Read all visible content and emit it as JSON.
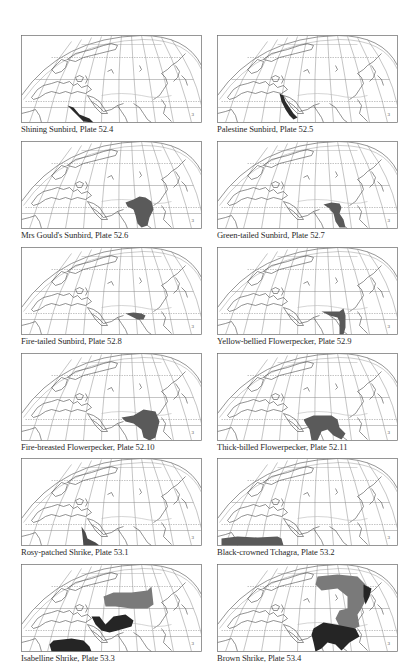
{
  "page": {
    "panels": [
      {
        "caption": "Shining Sunbird, Plate 52.4",
        "range_grey": "",
        "range_dark": "M46,70 L50,74 L56,80 L62,86 L72,87 L68,83 L58,79 L52,72 Z"
      },
      {
        "caption": "Palestine Sunbird, Plate 52.5",
        "range_grey": "",
        "range_dark": "M62,58 L66,60 L68,66 L72,72 L76,78 L80,82 L76,84 L72,80 L68,74 L64,66 Z"
      },
      {
        "caption": "Mrs Gould's Sunbird, Plate 52.6",
        "range_grey": "",
        "range_dark": "M104,61 L112,58 L118,55 L124,56 L130,60 L132,68 L128,76 L126,84 L120,86 L116,82 L114,74 L112,68 L106,65 Z"
      },
      {
        "caption": "Green-tailed Sunbird, Plate 52.7",
        "range_grey": "",
        "range_dark": "M106,63 L114,61 L122,62 L124,66 L122,72 L126,78 L128,86 L122,86 L118,80 L116,72 L112,67 Z"
      },
      {
        "caption": "Fire-tailed Sunbird, Plate 52.8",
        "range_grey": "",
        "range_dark": "M104,66 L112,65 L120,66 L124,68 L122,72 L116,72 L110,69 Z"
      },
      {
        "caption": "Yellow-bellied Flowerpecker, Plate 52.9",
        "range_grey": "",
        "range_dark": "M104,64 L114,64 L122,64 L126,61 L128,68 L128,80 L126,87 L122,87 L122,74 L120,70 L112,68 Z"
      },
      {
        "caption": "Fire-breasted Flowerpecker, Plate 52.10",
        "range_grey": "",
        "range_dark": "M100,64 L112,62 L122,56 L134,58 L138,68 L136,76 L134,84 L128,87 L122,84 L120,76 L112,70 L104,68 Z"
      },
      {
        "caption": "Thick-billed Flowerpecker, Plate 52.11",
        "range_grey": "",
        "range_dark": "M86,66 L96,62 L106,62 L114,62 L120,66 L122,74 L128,80 L124,86 L116,82 L110,76 L104,78 L100,87 L94,87 L92,76 L88,70 Z"
      },
      {
        "caption": "Rosy-patched Shrike, Plate 53.1",
        "range_grey": "",
        "range_dark": "M60,68 L64,74 L66,80 L74,84 L78,87 L62,87 Z"
      },
      {
        "caption": "Black-crowned Tchagra, Plate 53.2",
        "range_grey": "",
        "range_dark": "M4,80 L20,78 L40,79 L60,78 L64,80 L66,87 L4,87 Z"
      },
      {
        "caption": "Isabelline Shrike, Plate 53.3",
        "range_grey": "M82,32 L92,28 L110,28 L126,26 L130,22 L132,40 L126,44 L110,44 L94,42 L84,42 Z",
        "range_dark": "M70,52 L78,52 L84,60 L92,52 L104,50 L112,56 L110,62 L96,66 L88,68 L80,66 L74,60 Z M32,76 L50,74 L62,76 L68,82 L70,87 L30,87 L28,80 Z"
      },
      {
        "caption": "Brown Shrike, Plate 53.4",
        "range_grey": "M100,12 L120,10 L140,12 L148,20 L150,32 L144,44 L140,50 L142,62 L132,66 L122,62 L118,54 L122,46 L130,44 L130,32 L120,24 L104,26 L98,20 Z",
        "range_dark": "M146,20 L154,24 L152,32 L148,40 L146,32 Z M96,64 L106,58 L118,60 L128,62 L138,64 L142,72 L132,78 L124,86 L118,80 L110,78 L104,84 L98,87 L96,78 L94,70 Z"
      }
    ]
  },
  "colors": {
    "range_grey": "#6f6f6f",
    "range_dark": "#2a2a2a",
    "grid": "#8a8a8a",
    "coast": "#4a4a4a"
  }
}
